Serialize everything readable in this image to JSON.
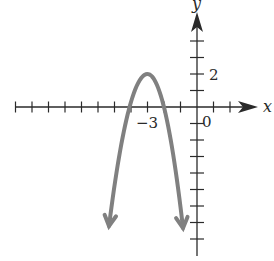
{
  "chart_data": {
    "type": "line",
    "title": "",
    "xlabel": "x",
    "ylabel": "y",
    "equation": "y = -2(x + 3)^2 + 2",
    "vertex": [
      -3,
      2
    ],
    "x_intercepts": [
      -4,
      -2
    ],
    "tick_labels": {
      "x": [
        "-3",
        "0"
      ],
      "y": [
        "2"
      ]
    },
    "xlim": [
      -11,
      2
    ],
    "ylim": [
      -8,
      4
    ],
    "grid": false,
    "series": [
      {
        "name": "parabola",
        "color": "#808080",
        "x": [
          -5.3,
          -5,
          -4.5,
          -4,
          -3.5,
          -3,
          -2.5,
          -2,
          -1.5,
          -1,
          -0.85
        ],
        "y": [
          -8.58,
          -6,
          -2.5,
          0,
          1.5,
          2,
          1.5,
          0,
          -2.5,
          -6,
          -7.25
        ],
        "arrows_at_ends": true
      }
    ]
  },
  "labels": {
    "x_axis": "x",
    "y_axis": "y",
    "tick_neg3": "−3",
    "tick_0": "0",
    "tick_2": "2"
  },
  "colors": {
    "axis": "#2a2a2a",
    "curve": "#808080",
    "background": "#ffffff"
  }
}
